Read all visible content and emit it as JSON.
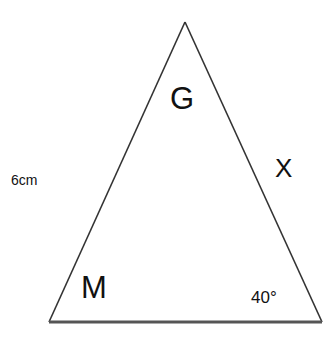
{
  "diagram": {
    "type": "triangle",
    "vertices": {
      "apex": [
        185,
        22
      ],
      "bottom_left": [
        49,
        322
      ],
      "bottom_right": [
        322,
        322
      ]
    },
    "stroke_color": "#333333",
    "labels": {
      "top_angle": "G",
      "left_side": "6cm",
      "right_side": "X",
      "bottom_left_angle": "M",
      "bottom_right_angle": "40°"
    }
  }
}
